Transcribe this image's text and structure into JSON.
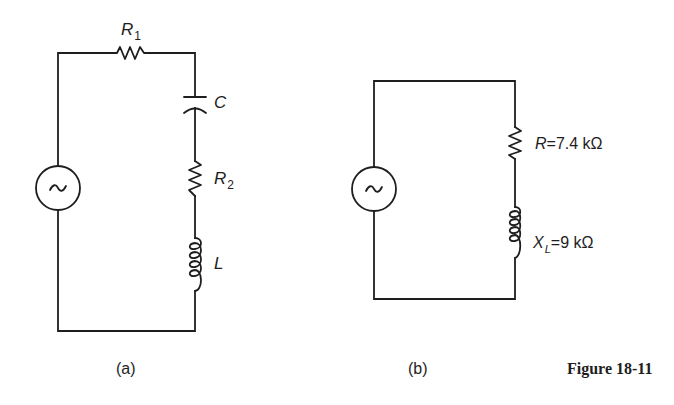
{
  "figure": {
    "caption": "Figure 18-11"
  },
  "circuit_a": {
    "caption": "(a)",
    "source": {
      "symbol": "~",
      "type": "ac-source"
    },
    "components": [
      {
        "id": "R1",
        "type": "resistor",
        "symbol": "R",
        "subscript": "1"
      },
      {
        "id": "C",
        "type": "capacitor",
        "symbol": "C"
      },
      {
        "id": "R2",
        "type": "resistor",
        "symbol": "R",
        "subscript": "2"
      },
      {
        "id": "L",
        "type": "inductor",
        "symbol": "L"
      }
    ]
  },
  "circuit_b": {
    "caption": "(b)",
    "source": {
      "symbol": "~",
      "type": "ac-source"
    },
    "components": [
      {
        "id": "R",
        "type": "resistor",
        "symbol": "R",
        "value_text": "=7.4 kΩ"
      },
      {
        "id": "XL",
        "type": "inductor",
        "symbol": "X",
        "subscript": "L",
        "value_text": "=9 kΩ"
      }
    ]
  },
  "colors": {
    "ink": "#1e1e1e",
    "background": "#ffffff"
  }
}
